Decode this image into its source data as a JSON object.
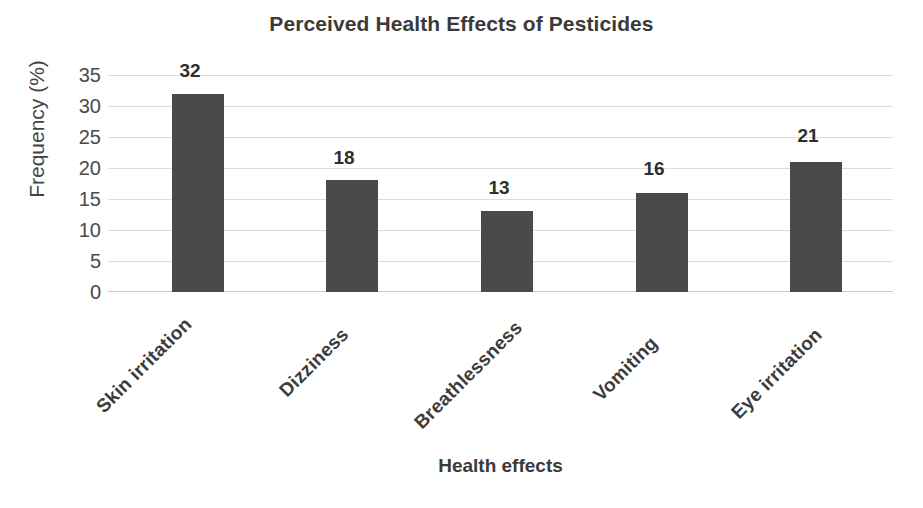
{
  "chart_data": {
    "type": "bar",
    "title": "Perceived Health Effects of Pesticides",
    "xlabel": "Health effects",
    "ylabel": "Frequency (%)",
    "categories": [
      "Skin irritation",
      "Dizziness",
      "Breathlessness",
      "Vomiting",
      "Eye irritation"
    ],
    "values": [
      32,
      18,
      13,
      16,
      21
    ],
    "data_labels": [
      "32",
      "18",
      "13",
      "16",
      "21"
    ],
    "ylim": [
      0,
      35
    ],
    "yticks": [
      0,
      5,
      10,
      15,
      20,
      25,
      30,
      35
    ],
    "ytick_labels": [
      "0",
      "5",
      "10",
      "15",
      "20",
      "25",
      "30",
      "35"
    ],
    "grid": true,
    "grid_axis": "y",
    "legend": false,
    "legend_position": "none",
    "series": [
      {
        "name": "Frequency (%)",
        "values": [
          32,
          18,
          13,
          16,
          21
        ]
      }
    ],
    "colors": {
      "bar_fill": "#4a4a4a",
      "gridline": "#dcdcdc",
      "baseline": "#c9c9c9",
      "text": "#3a3a3a",
      "background": "#ffffff"
    }
  }
}
